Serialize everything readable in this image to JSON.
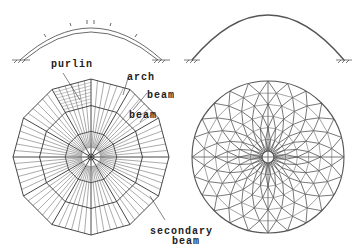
{
  "figure": {
    "left_elevation": {
      "description": "arch with purlins elevation"
    },
    "right_elevation": {
      "description": "single-layer arch elevation"
    },
    "left_plan": {
      "description": "ribbed dome plan",
      "labels": {
        "purlin": "purlin",
        "arch": "arch",
        "beam_outer": "beam",
        "beam_inner": "beam",
        "secondary_beam_line1": "secondary",
        "secondary_beam_line2": "beam"
      }
    },
    "right_plan": {
      "description": "lamella / spiral lattice dome plan"
    },
    "colors": {
      "line": "#333333",
      "line_light": "#666666",
      "background": "#ffffff"
    }
  }
}
